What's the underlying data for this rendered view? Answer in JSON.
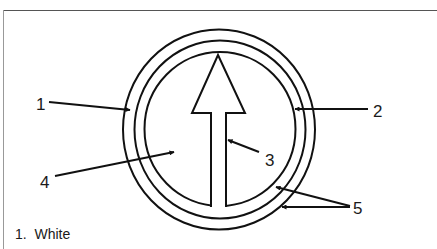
{
  "figure": {
    "colors": {
      "stroke": "#111111",
      "background": "#ffffff"
    },
    "shapes": {
      "outer_ring": {
        "cx": 219,
        "cy": 129.5,
        "rx": 96,
        "ry": 100
      },
      "middle_ring": {
        "cx": 220,
        "cy": 129.5,
        "rx": 85.5,
        "ry": 89
      },
      "inner_ring": {
        "cx": 220,
        "cy": 129,
        "rx": 75.5,
        "ry": 77
      },
      "arrow": {
        "tip": [
          218,
          55
        ],
        "head_left": 192,
        "head_right": 245,
        "head_base_y": 113,
        "shaft_left": 211,
        "shaft_right": 226,
        "shaft_bottom": 205
      }
    },
    "callouts": [
      {
        "label": "1",
        "label_pos": [
          36,
          110
        ],
        "line_from": [
          49,
          102
        ],
        "line_to": [
          129,
          110
        ]
      },
      {
        "label": "2",
        "label_pos": [
          373,
          117
        ],
        "line_from": [
          368,
          109
        ],
        "line_to": [
          296,
          109
        ]
      },
      {
        "label": "3",
        "label_pos": [
          265,
          166
        ],
        "line_from": [
          259,
          152
        ],
        "line_to": [
          228,
          140
        ]
      },
      {
        "label": "4",
        "label_pos": [
          40,
          188
        ],
        "line_from": [
          55,
          176
        ],
        "line_to": [
          173,
          152
        ]
      },
      {
        "label": "5",
        "label_pos": [
          353,
          214
        ],
        "line_from": [
          350,
          206
        ],
        "line_to": [
          [
            277,
            187
          ],
          [
            283,
            207
          ]
        ]
      }
    ]
  },
  "legend": {
    "items": [
      {
        "number": "1.",
        "text": "White"
      }
    ]
  }
}
